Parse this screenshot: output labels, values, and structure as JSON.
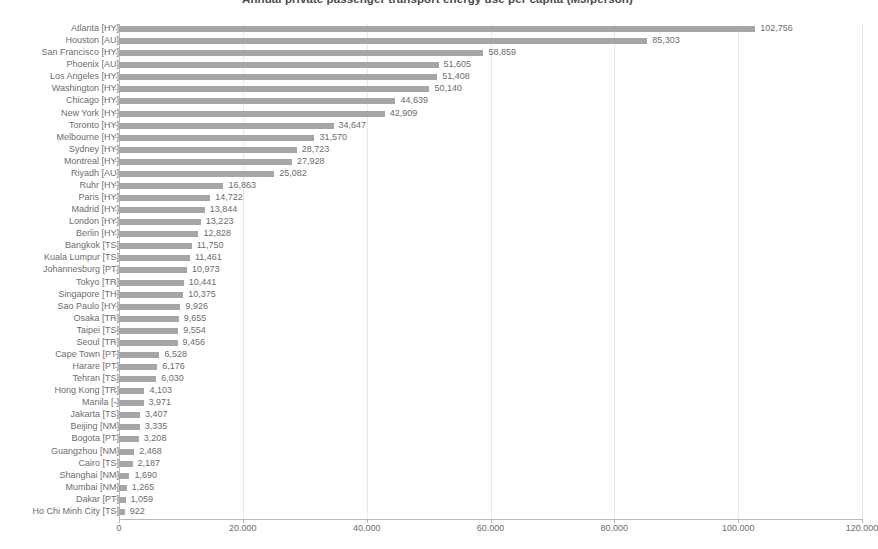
{
  "chart_data": {
    "type": "bar",
    "orientation": "horizontal",
    "title": "Annual private passenger transport energy use per capita (MJ/person)",
    "xlabel": "",
    "ylabel": "",
    "xlim": [
      0,
      120000
    ],
    "grid": true,
    "legend": "none",
    "x_tick_labels": [
      "0",
      "20.000",
      "40.000",
      "60.000",
      "80.000",
      "100.000",
      "120.000"
    ],
    "x_tick_values": [
      0,
      20000,
      40000,
      60000,
      80000,
      100000,
      120000
    ],
    "bar_color": "#a6a6a6",
    "categories": [
      "Atlanta [HY]",
      "Houston [AU]",
      "San Francisco [HY]",
      "Phoenix [AU]",
      "Los Angeles [HY]",
      "Washington [HY]",
      "Chicago [HY]",
      "New York [HY]",
      "Toronto [HY]",
      "Melbourne [HY]",
      "Sydney [HY]",
      "Montreal [HY]",
      "Riyadh [AU]",
      "Ruhr [HY]",
      "Paris [HY]",
      "Madrid [HY]",
      "London [HY]",
      "Berlin [HY]",
      "Bangkok [TS]",
      "Kuala Lumpur [TS]",
      "Johannesburg [PT]",
      "Tokyo [TR]",
      "Singapore [TH]",
      "Sao Paulo [HY]",
      "Osaka [TR]",
      "Taipei [TS]",
      "Seoul [TR]",
      "Cape Town [PT]",
      "Harare [PT]",
      "Tehran [TS]",
      "Hong Kong [TR]",
      "Manila [-]",
      "Jakarta [TS]",
      "Beijing [NM]",
      "Bogota [PT]",
      "Guangzhou [NM]",
      "Cairo [TS]",
      "Shanghai [NM]",
      "Mumbai [NM]",
      "Dakar [PT]",
      "Ho Chi Minh City [TS]"
    ],
    "values": [
      102756,
      85303,
      58859,
      51605,
      51408,
      50140,
      44639,
      42909,
      34647,
      31570,
      28723,
      27928,
      25082,
      16863,
      14722,
      13844,
      13223,
      12828,
      11750,
      11461,
      10973,
      10441,
      10375,
      9926,
      9655,
      9554,
      9456,
      6528,
      6176,
      6030,
      4103,
      3971,
      3407,
      3335,
      3208,
      2468,
      2187,
      1690,
      1265,
      1059,
      922
    ],
    "value_labels": [
      "102,756",
      "85,303",
      "58,859",
      "51,605",
      "51,408",
      "50,140",
      "44,639",
      "42,909",
      "34,647",
      "31,570",
      "28,723",
      "27,928",
      "25,082",
      "16,863",
      "14,722",
      "13,844",
      "13,223",
      "12,828",
      "11,750",
      "11,461",
      "10,973",
      "10,441",
      "10,375",
      "9,926",
      "9,655",
      "9,554",
      "9,456",
      "6,528",
      "6,176",
      "6,030",
      "4,103",
      "3,971",
      "3,407",
      "3,335",
      "3,208",
      "2,468",
      "2,187",
      "1,690",
      "1,265",
      "1,059",
      "922"
    ]
  }
}
